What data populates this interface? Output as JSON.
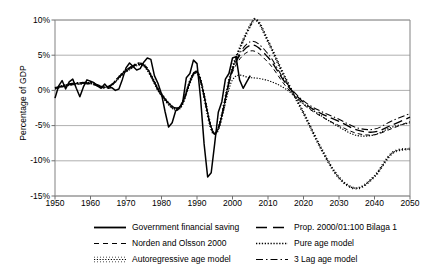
{
  "axes": {
    "ylabel": "Percentage of GDP",
    "yticks": [
      "10%",
      "5%",
      "0%",
      "-5%",
      "-10%",
      "-15%"
    ],
    "xticks": [
      "1950",
      "1960",
      "1970",
      "1980",
      "1990",
      "2000",
      "2010",
      "2020",
      "2030",
      "2040",
      "2050"
    ]
  },
  "legend": [
    {
      "label": "Government financial saving",
      "style": "solid",
      "key": "line-key-solid"
    },
    {
      "label": "Prop. 2000/01:100 Bilaga 1",
      "style": "long-dash",
      "key": "line-key-long-dash"
    },
    {
      "label": "Norden and Olsson 2000",
      "style": "short-dash",
      "key": "line-key-short-dash"
    },
    {
      "label": "Pure age model",
      "style": "dotted",
      "key": "line-key-dotted"
    },
    {
      "label": "Autoregressive age model",
      "style": "tick-dotted",
      "key": "line-key-tick-dotted"
    },
    {
      "label": "3 Lag age model",
      "style": "dash-dot",
      "key": "line-key-dash-dot"
    }
  ],
  "chart_data": {
    "type": "line",
    "title": "",
    "xlabel": "",
    "ylabel": "Percentage of GDP",
    "xlim": [
      1950,
      2050
    ],
    "ylim": [
      -15,
      10
    ],
    "grid": true,
    "legend_position": "bottom",
    "yticks": [
      10,
      5,
      0,
      -5,
      -10,
      -15
    ],
    "xticks": [
      1950,
      1960,
      1970,
      1980,
      1990,
      2000,
      2010,
      2020,
      2030,
      2040,
      2050
    ],
    "series": [
      {
        "name": "Government financial saving",
        "style": "solid",
        "x": [
          1950,
          1951,
          1952,
          1953,
          1954,
          1955,
          1956,
          1957,
          1958,
          1959,
          1960,
          1961,
          1962,
          1963,
          1964,
          1965,
          1966,
          1967,
          1968,
          1969,
          1970,
          1971,
          1972,
          1973,
          1974,
          1975,
          1976,
          1977,
          1978,
          1979,
          1980,
          1981,
          1982,
          1983,
          1984,
          1985,
          1986,
          1987,
          1988,
          1989,
          1990,
          1991,
          1992,
          1993,
          1994,
          1995,
          1996,
          1997,
          1998,
          1999,
          2000,
          2001,
          2002,
          2003,
          2004,
          2005
        ],
        "values": [
          -1.1,
          0.6,
          1.4,
          0.2,
          1.2,
          1.6,
          0.3,
          -0.9,
          0.5,
          1.5,
          1.3,
          1.1,
          0.6,
          0.3,
          0.9,
          0.3,
          0.4,
          0.0,
          0.2,
          1.6,
          3.2,
          3.9,
          3.4,
          2.9,
          3.1,
          4.0,
          4.6,
          4.4,
          2.1,
          1.0,
          -0.5,
          -3.0,
          -5.2,
          -4.6,
          -2.9,
          -2.5,
          -1.6,
          1.8,
          2.4,
          4.3,
          3.8,
          -1.1,
          -7.6,
          -12.3,
          -11.7,
          -7.5,
          -3.1,
          -1.6,
          1.6,
          2.4,
          4.6,
          4.8,
          1.5,
          0.3,
          1.2,
          2.1
        ]
      },
      {
        "name": "Prop. 2000/01:100 Bilaga 1",
        "style": "long-dash",
        "x": [
          1950,
          1955,
          1960,
          1965,
          1970,
          1975,
          1980,
          1985,
          1990,
          1995,
          2000,
          2005,
          2010,
          2015,
          2020,
          2025,
          2030,
          2035,
          2040,
          2045,
          2050
        ],
        "values": [
          0.3,
          0.9,
          1.0,
          0.5,
          2.8,
          3.6,
          -0.6,
          -2.4,
          2.6,
          -6.2,
          2.9,
          6.4,
          4.7,
          1.0,
          -1.7,
          -3.3,
          -4.4,
          -5.6,
          -5.9,
          -4.9,
          -3.8
        ]
      },
      {
        "name": "Norden and Olsson 2000",
        "style": "short-dash",
        "x": [
          1950,
          1955,
          1960,
          1965,
          1970,
          1975,
          1980,
          1985,
          1990,
          1995,
          2000,
          2005,
          2010,
          2015,
          2020,
          2025,
          2030,
          2035,
          2040,
          2045,
          2050
        ],
        "values": [
          0.2,
          0.8,
          0.9,
          0.4,
          2.7,
          3.5,
          -0.7,
          -2.6,
          2.5,
          -6.0,
          2.6,
          5.6,
          4.0,
          0.6,
          -2.0,
          -3.7,
          -5.0,
          -6.1,
          -6.3,
          -5.4,
          -4.4
        ]
      },
      {
        "name": "Pure age model",
        "style": "dotted",
        "x": [
          1950,
          1955,
          1960,
          1965,
          1970,
          1975,
          1980,
          1985,
          1990,
          1995,
          2000,
          2005,
          2010,
          2015,
          2020,
          2025,
          2030,
          2035,
          2040,
          2045,
          2050
        ],
        "values": [
          0.3,
          1.0,
          1.1,
          0.5,
          2.6,
          3.4,
          -0.8,
          -2.7,
          2.4,
          -6.1,
          1.5,
          1.8,
          1.4,
          0.2,
          -1.9,
          -3.6,
          -5.2,
          -6.4,
          -6.3,
          -5.2,
          -4.6
        ]
      },
      {
        "name": "Autoregressive age model",
        "style": "tick-dotted",
        "x": [
          1950,
          1955,
          1960,
          1965,
          1970,
          1975,
          1980,
          1985,
          1990,
          1995,
          2000,
          2005,
          2007,
          2010,
          2015,
          2020,
          2025,
          2030,
          2035,
          2040,
          2045,
          2050
        ],
        "values": [
          0.3,
          0.9,
          1.0,
          0.5,
          2.8,
          3.6,
          -0.6,
          -2.5,
          2.6,
          -6.2,
          3.2,
          9.2,
          9.9,
          7.0,
          1.6,
          -3.2,
          -8.3,
          -12.4,
          -13.9,
          -12.2,
          -8.9,
          -8.3
        ]
      },
      {
        "name": "3 Lag age model",
        "style": "dash-dot",
        "x": [
          1950,
          1955,
          1960,
          1965,
          1970,
          1975,
          1980,
          1985,
          1990,
          1995,
          2000,
          2005,
          2010,
          2015,
          2020,
          2025,
          2030,
          2035,
          2040,
          2045,
          2050
        ],
        "values": [
          0.4,
          1.0,
          1.1,
          0.6,
          2.9,
          3.7,
          -0.5,
          -2.4,
          2.7,
          -6.1,
          3.0,
          6.9,
          5.2,
          1.2,
          -1.5,
          -3.0,
          -4.1,
          -5.3,
          -5.5,
          -4.3,
          -3.3
        ]
      }
    ]
  }
}
